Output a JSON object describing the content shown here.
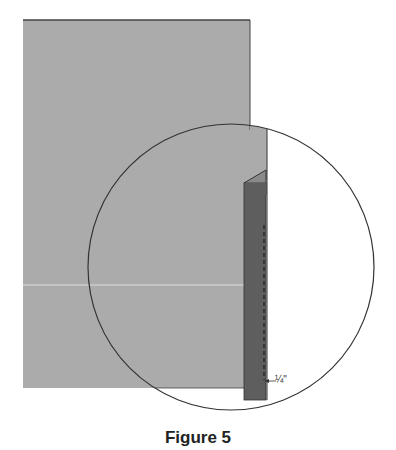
{
  "figure": {
    "caption": "Figure 5",
    "measurement_label": "¼\"",
    "colors": {
      "fabric": "#ababab",
      "fold": "#5e5e5e",
      "outline": "#333333",
      "seam_line": "#dcdcdc"
    }
  }
}
